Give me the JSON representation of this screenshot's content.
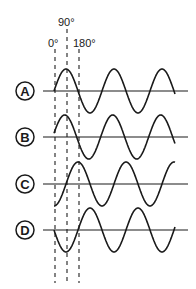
{
  "diagram": {
    "angle_labels": [
      {
        "text": "0°",
        "x": 48,
        "y": 47,
        "line_x": 55,
        "line_top": 49
      },
      {
        "text": "90°",
        "x": 58,
        "y": 26,
        "line_x": 67,
        "line_top": 29
      },
      {
        "text": "180°",
        "x": 73,
        "y": 47,
        "line_x": 79,
        "line_top": 49
      }
    ],
    "dashed_bottom": 283,
    "axis_x_start": 43,
    "axis_x_end": 188,
    "wave_x_start": 54,
    "wave_x_end": 175,
    "period_px": 48,
    "amplitude_px": 22,
    "waves": [
      {
        "label": "A",
        "axis_y": 91,
        "phase_deg": 0,
        "desc": "starts at 0, rises to peak at 90°"
      },
      {
        "label": "B",
        "axis_y": 137,
        "phase_deg": 10,
        "desc": "slightly leading A"
      },
      {
        "label": "C",
        "axis_y": 184,
        "phase_deg": -90,
        "desc": "starts at trough, peak at 180°"
      },
      {
        "label": "D",
        "axis_y": 230,
        "phase_deg": 180,
        "desc": "starts at 0 going down, trough at 90°"
      }
    ],
    "label_circle_x": 25,
    "label_circle_r": 9,
    "stroke_color": "#1a1a1a",
    "dash_color": "#333333"
  }
}
